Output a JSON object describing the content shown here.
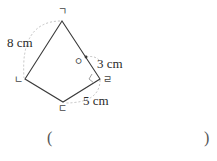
{
  "figure": {
    "type": "quadrilateral (kite)",
    "vertices": [
      {
        "id": "giyeok",
        "label": "ㄱ",
        "x": 62,
        "y": 21
      },
      {
        "id": "nieun",
        "label": "ㄴ",
        "x": 25,
        "y": 79
      },
      {
        "id": "digeut",
        "label": "ㄷ",
        "x": 63,
        "y": 102
      },
      {
        "id": "rieul",
        "label": "ㄹ",
        "x": 100,
        "y": 79
      }
    ],
    "point_o": {
      "label": "ㅇ",
      "x": 86,
      "y": 57
    },
    "measurements": [
      {
        "id": "side-giyeok-nieun",
        "text": "8 cm"
      },
      {
        "id": "segment-o-rieul",
        "text": "3 cm"
      },
      {
        "id": "side-digeut-rieul",
        "text": "5 cm"
      }
    ],
    "right_angle_at": "ㄹ"
  },
  "answer": {
    "open_paren": "(",
    "close_paren": ")",
    "value": ""
  },
  "colors": {
    "line": "#3a3a3a",
    "dashed": "#bbbbbb",
    "text": "#2a2a2a"
  }
}
